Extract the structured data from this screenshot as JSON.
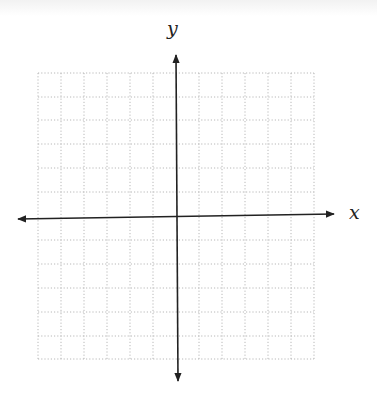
{
  "diagram": {
    "type": "coordinate-plane",
    "x_axis_label": "x",
    "y_axis_label": "y",
    "grid": {
      "columns": 12,
      "rows": 12,
      "columns_each_side": 6,
      "rows_each_side": 6,
      "line_style": "dotted",
      "line_color": "#b8b8b8"
    },
    "axis_color": "#222222",
    "arrows": [
      "left",
      "right",
      "up",
      "down"
    ]
  }
}
